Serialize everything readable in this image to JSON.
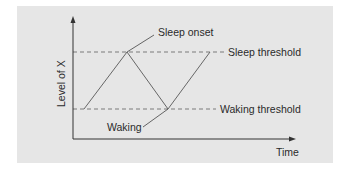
{
  "diagram": {
    "y_axis_label": "Level of X",
    "x_axis_label": "Time",
    "annotations": {
      "sleep_onset": "Sleep onset",
      "waking": "Waking"
    },
    "thresholds": {
      "sleep": "Sleep threshold",
      "waking": "Waking threshold"
    },
    "colors": {
      "panel_background": "#e6e6e6",
      "line": "#555555",
      "dashed_line": "#7a7a7a",
      "axis": "#333333",
      "text": "#2a2a2a"
    }
  }
}
